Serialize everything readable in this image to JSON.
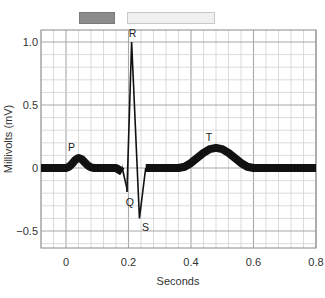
{
  "header": {
    "bars": [
      {
        "name": "dark-bar",
        "color": "#8c8c8c",
        "border": "#7a7a7a"
      },
      {
        "name": "light-bar",
        "color": "#f0f0f0",
        "border": "#c8c8c8"
      }
    ]
  },
  "chart_data": {
    "type": "line",
    "title": "",
    "xlabel": "Seconds",
    "ylabel": "Millivolts (mV)",
    "xlim": [
      -0.08,
      0.8
    ],
    "ylim": [
      -0.7,
      1.1
    ],
    "x_ticks": [
      0,
      0.2,
      0.4,
      0.6,
      0.8
    ],
    "x_tick_labels": [
      "0",
      "0.2",
      "0.4",
      "0.6",
      "0.8"
    ],
    "y_ticks": [
      1.0,
      0.5,
      0,
      -0.5
    ],
    "y_tick_labels": [
      "1.0",
      "0.5",
      "0",
      "−0.5"
    ],
    "grid": true,
    "minor_grid_step_x": 0.04,
    "minor_grid_step_y": 0.1,
    "series": [
      {
        "name": "ECG trace",
        "x": [
          -0.08,
          0.0,
          0.01,
          0.02,
          0.03,
          0.04,
          0.05,
          0.06,
          0.07,
          0.08,
          0.09,
          0.1,
          0.12,
          0.14,
          0.16,
          0.18,
          0.195,
          0.21,
          0.235,
          0.255,
          0.28,
          0.3,
          0.32,
          0.34,
          0.36,
          0.38,
          0.4,
          0.42,
          0.44,
          0.46,
          0.48,
          0.5,
          0.52,
          0.54,
          0.56,
          0.58,
          0.6,
          0.65,
          0.7,
          0.75,
          0.8
        ],
        "y": [
          0,
          0,
          0.01,
          0.035,
          0.065,
          0.08,
          0.07,
          0.045,
          0.02,
          0.005,
          0,
          0,
          0,
          0,
          0,
          -0.03,
          -0.19,
          1.0,
          -0.4,
          0,
          0,
          0,
          0,
          0,
          0,
          0.01,
          0.04,
          0.08,
          0.12,
          0.15,
          0.16,
          0.15,
          0.12,
          0.08,
          0.04,
          0.01,
          0,
          0,
          0,
          0,
          0
        ]
      }
    ],
    "annotations": [
      {
        "text": "P",
        "x": 0.04,
        "y": 0.08
      },
      {
        "text": "Q",
        "x": 0.195,
        "y": -0.19
      },
      {
        "text": "R",
        "x": 0.21,
        "y": 1.0
      },
      {
        "text": "S",
        "x": 0.235,
        "y": -0.4
      },
      {
        "text": "T",
        "x": 0.48,
        "y": 0.16
      }
    ],
    "legend": null
  }
}
